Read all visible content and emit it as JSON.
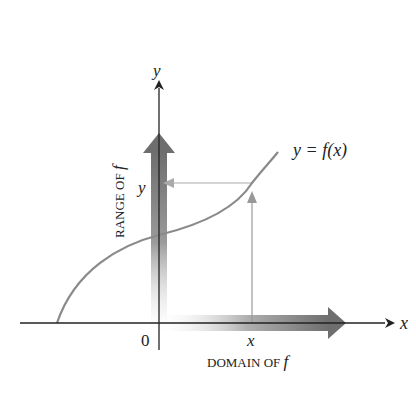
{
  "diagram": {
    "axes": {
      "x_label": "x",
      "y_label": "y",
      "origin_label": "0"
    },
    "curve_label": "y = f(x)",
    "point_labels": {
      "x": "x",
      "y": "y"
    },
    "range_label": "RANGE OF",
    "domain_label": "DOMAIN OF",
    "f_symbol": "f",
    "colors": {
      "axis": "#222222",
      "curve": "#8a8a8a",
      "guide": "#999999",
      "range_arrow": "#7a7a7a",
      "domain_arrow": "#7a7a7a"
    }
  }
}
